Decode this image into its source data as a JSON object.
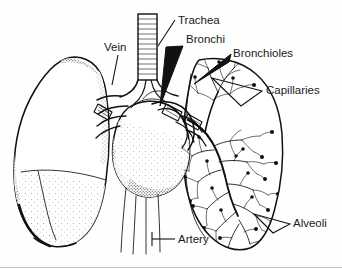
{
  "figure": {
    "style": "black-and-white line art with stipple shading",
    "background_color": "#fefefe",
    "ink_color": "#111111"
  },
  "labels": [
    {
      "id": "trachea",
      "text": "Trachea",
      "text_x": 178,
      "text_y": 24,
      "leader_type": "line",
      "anchor_x": 160,
      "anchor_y": 48
    },
    {
      "id": "bronchi",
      "text": "Bronchi",
      "text_x": 186,
      "text_y": 43,
      "leader_type": "solid-wedge",
      "anchor_x": 160,
      "anchor_y": 105
    },
    {
      "id": "bronchioles",
      "text": "Bronchioles",
      "text_x": 233,
      "text_y": 57,
      "leader_type": "solid-wedge",
      "anchor_x": 196,
      "anchor_y": 86
    },
    {
      "id": "capillaries",
      "text": "Capillaries",
      "text_x": 266,
      "text_y": 94,
      "leader_type": "open-wedge",
      "anchor_x": 214,
      "anchor_y": 80
    },
    {
      "id": "vein",
      "text": "Vein",
      "text_x": 104,
      "text_y": 51,
      "leader_type": "line",
      "anchor_x": 112,
      "anchor_y": 82
    },
    {
      "id": "artery",
      "text": "Artery",
      "text_x": 178,
      "text_y": 243,
      "leader_type": "line",
      "anchor_x": 150,
      "anchor_y": 239
    },
    {
      "id": "alveoli",
      "text": "Alveoli",
      "text_x": 293,
      "text_y": 227,
      "leader_type": "open-wedge",
      "anchor_x": 256,
      "anchor_y": 218
    }
  ],
  "structures": [
    {
      "id": "left-lung",
      "name": "Left lung (intact, shaded)"
    },
    {
      "id": "right-lung",
      "name": "Right lung (cutaway showing bronchial tree)"
    },
    {
      "id": "heart",
      "name": "Heart"
    },
    {
      "id": "trachea-tube",
      "name": "Trachea with cartilage rings"
    },
    {
      "id": "bronchial-tree",
      "name": "Branching bronchi and bronchioles"
    },
    {
      "id": "alveoli-dots",
      "name": "Alveolar sacs at branch terminals"
    },
    {
      "id": "great-vessels",
      "name": "Descending great vessels"
    }
  ]
}
